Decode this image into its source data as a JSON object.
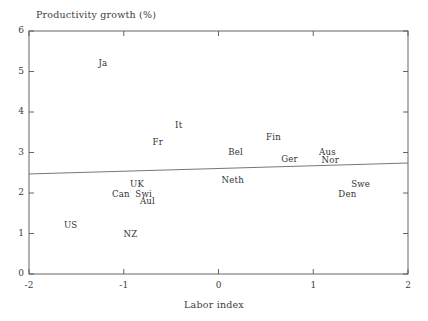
{
  "chart_data": {
    "type": "scatter",
    "title": "",
    "xlabel": "Labor index",
    "ylabel": "Productivity growth (%)",
    "xlim": [
      -2,
      2
    ],
    "ylim": [
      0,
      6
    ],
    "xticks": [
      "-2",
      "-1",
      "0",
      "1",
      "2"
    ],
    "xtick_values": [
      -2,
      -1,
      0,
      1,
      2
    ],
    "yticks": [
      "0",
      "1",
      "2",
      "3",
      "4",
      "5",
      "6"
    ],
    "ytick_values": [
      0,
      1,
      2,
      3,
      4,
      5,
      6
    ],
    "grid": false,
    "legend": "none",
    "marker_style": "text-label-only",
    "points": [
      {
        "label": "Ja",
        "x": -1.22,
        "y": 5.2
      },
      {
        "label": "It",
        "x": -0.42,
        "y": 3.68
      },
      {
        "label": "Fr",
        "x": -0.64,
        "y": 3.25
      },
      {
        "label": "Bel",
        "x": 0.18,
        "y": 3.02
      },
      {
        "label": "Fin",
        "x": 0.58,
        "y": 3.38
      },
      {
        "label": "Ger",
        "x": 0.75,
        "y": 2.84
      },
      {
        "label": "Aus",
        "x": 1.15,
        "y": 3.02
      },
      {
        "label": "Nor",
        "x": 1.18,
        "y": 2.82
      },
      {
        "label": "Neth",
        "x": 0.15,
        "y": 2.32
      },
      {
        "label": "UK",
        "x": -0.86,
        "y": 2.22
      },
      {
        "label": "Can",
        "x": -1.03,
        "y": 1.98
      },
      {
        "label": "Swi",
        "x": -0.79,
        "y": 1.98
      },
      {
        "label": "Aul",
        "x": -0.75,
        "y": 1.8
      },
      {
        "label": "US",
        "x": -1.56,
        "y": 1.21
      },
      {
        "label": "NZ",
        "x": -0.93,
        "y": 0.99
      },
      {
        "label": "Swe",
        "x": 1.5,
        "y": 2.22
      },
      {
        "label": "Den",
        "x": 1.36,
        "y": 1.98
      }
    ],
    "fit_line": {
      "name": "regression-line",
      "x_start": -2,
      "y_start": 2.47,
      "x_end": 2,
      "y_end": 2.74
    }
  },
  "colors": {
    "background": "#ffffff",
    "axis": "#555555",
    "text": "#333333",
    "line": "#666666"
  }
}
